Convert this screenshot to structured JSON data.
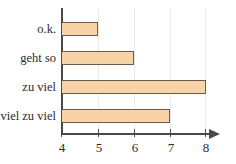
{
  "chart_data": {
    "type": "bar",
    "orientation": "horizontal",
    "title": "",
    "xlabel": "",
    "ylabel": "",
    "categories": [
      "o.k.",
      "geht so",
      "zu viel",
      "viel zu viel"
    ],
    "values": [
      5,
      6,
      8,
      7
    ],
    "xlim": [
      4,
      8
    ],
    "xticks": [
      4,
      5,
      6,
      7,
      8
    ],
    "xtick_labels": [
      "4",
      "5",
      "6",
      "7",
      "8"
    ],
    "grid": true,
    "grid_axis": "x",
    "legend": false,
    "bar_fill_color": "#F8D3A8",
    "bar_border_color": "#6B5B4B",
    "axis_color": "#4A4A4A",
    "grid_color": "#E9E9EC",
    "background_color": "#FFFFFF",
    "axis_arrow": true
  },
  "axis": {
    "arrow_icon": "arrow-right-icon"
  }
}
